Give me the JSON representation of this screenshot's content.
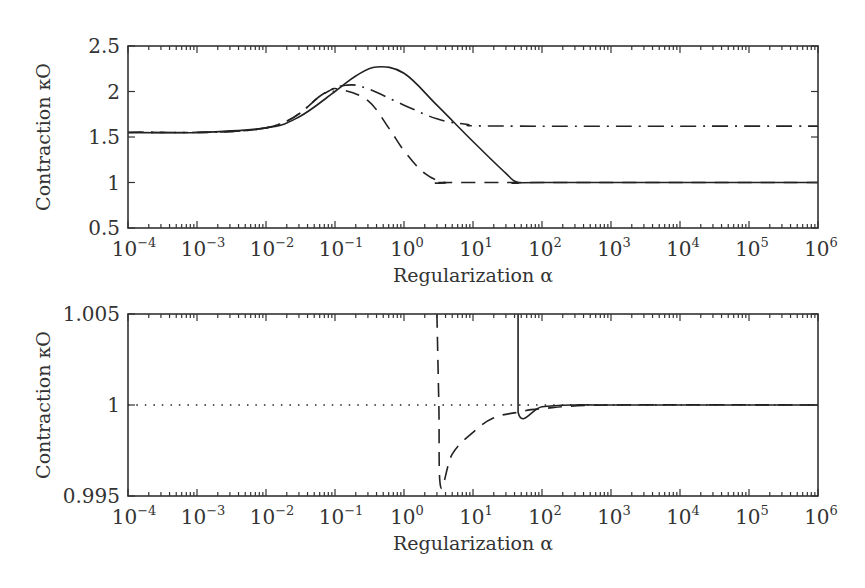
{
  "chart_data": [
    {
      "type": "line",
      "panel": "top",
      "xlabel": "Regularization α",
      "ylabel": "Contraction κO",
      "xscale": "log",
      "xlim": [
        0.0001,
        1000000
      ],
      "ylim": [
        0.5,
        2.5
      ],
      "xticks": [
        "10^-4",
        "10^-3",
        "10^-2",
        "10^-1",
        "10^0",
        "10^1",
        "10^2",
        "10^3",
        "10^4",
        "10^5",
        "10^6"
      ],
      "yticks": [
        "0.5",
        "1",
        "1.5",
        "2",
        "2.5"
      ],
      "grid": false,
      "legend": null,
      "series": [
        {
          "name": "solid",
          "style": "solid",
          "x": [
            0.0001,
            0.001,
            0.01,
            0.03,
            0.1,
            0.2,
            0.4,
            1,
            3,
            10,
            30,
            45,
            100,
            1000000
          ],
          "y": [
            1.55,
            1.55,
            1.6,
            1.72,
            2.0,
            2.17,
            2.27,
            2.2,
            1.85,
            1.45,
            1.1,
            1.0,
            1.0,
            1.0
          ]
        },
        {
          "name": "dash-dot",
          "style": "dashdot",
          "x": [
            0.0001,
            0.01,
            0.07,
            0.15,
            0.3,
            1,
            3,
            8,
            30,
            1000000
          ],
          "y": [
            1.55,
            1.6,
            1.98,
            2.07,
            2.03,
            1.85,
            1.7,
            1.64,
            1.62,
            1.62
          ]
        },
        {
          "name": "dashed",
          "style": "dashed",
          "x": [
            0.0001,
            0.01,
            0.07,
            0.12,
            0.3,
            0.6,
            1,
            2,
            4,
            8,
            1000000
          ],
          "y": [
            1.55,
            1.6,
            1.98,
            2.02,
            1.9,
            1.6,
            1.35,
            1.1,
            1.0,
            1.0,
            1.0
          ]
        },
        {
          "name": "dotted",
          "style": "dotted",
          "x": [
            0.07,
            0.12
          ],
          "y": [
            1.98,
            2.02
          ]
        }
      ]
    },
    {
      "type": "line",
      "panel": "bottom",
      "xlabel": "Regularization α",
      "ylabel": "Contraction κO",
      "xscale": "log",
      "xlim": [
        0.0001,
        1000000
      ],
      "ylim": [
        0.995,
        1.005
      ],
      "xticks": [
        "10^-4",
        "10^-3",
        "10^-2",
        "10^-1",
        "10^0",
        "10^1",
        "10^2",
        "10^3",
        "10^4",
        "10^5",
        "10^6"
      ],
      "yticks": [
        "0.995",
        "1",
        "1.005"
      ],
      "grid": false,
      "legend": null,
      "series": [
        {
          "name": "dotted",
          "style": "dotted",
          "x": [
            0.0001,
            1000000
          ],
          "y": [
            1.0,
            1.0
          ]
        },
        {
          "name": "dashed",
          "style": "dashed",
          "x": [
            3.0,
            3.2,
            3.4,
            5,
            10,
            20,
            45,
            100,
            1000,
            1000000
          ],
          "y": [
            1.005,
            1.0,
            0.9955,
            0.9973,
            0.9985,
            0.9993,
            0.9996,
            0.9998,
            1.0,
            1.0
          ]
        },
        {
          "name": "solid",
          "style": "solid",
          "x": [
            45,
            45,
            100,
            300,
            1000,
            1000000
          ],
          "y": [
            1.005,
            0.9996,
            0.9999,
            1.0,
            1.0,
            1.0
          ]
        }
      ]
    }
  ],
  "labels": {
    "top": {
      "xlabel": "Regularization α",
      "ylabel": "Contraction κO",
      "yticks": [
        "2.5",
        "2",
        "1.5",
        "1",
        "0.5"
      ]
    },
    "bottom": {
      "xlabel": "Regularization α",
      "ylabel": "Contraction κO",
      "yticks": [
        "1.005",
        "1",
        "0.995"
      ]
    },
    "xtick_base": "10",
    "xtick_exponents": [
      "−4",
      "−3",
      "−2",
      "−1",
      "0",
      "1",
      "2",
      "3",
      "4",
      "5",
      "6"
    ]
  }
}
